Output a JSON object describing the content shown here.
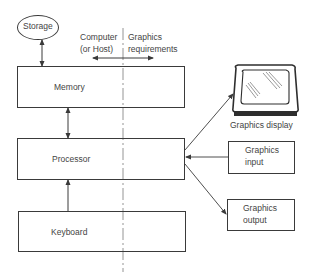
{
  "diagram": {
    "nodes": {
      "storage": {
        "label": "Storage",
        "shape": "ellipse"
      },
      "memory": {
        "label": "Memory",
        "shape": "rectangle"
      },
      "processor": {
        "label": "Processor",
        "shape": "rectangle"
      },
      "keyboard": {
        "label": "Keyboard",
        "shape": "rectangle"
      },
      "graphics_display": {
        "label": "Graphics display",
        "shape": "monitor-icon"
      },
      "graphics_input": {
        "label_line1": "Graphics",
        "label_line2": "input",
        "shape": "rectangle"
      },
      "graphics_output": {
        "label_line1": "Graphics",
        "label_line2": "output",
        "shape": "rectangle"
      }
    },
    "divider": {
      "left_label_line1": "Computer",
      "left_label_line2": "(or Host)",
      "right_label_line1": "Graphics",
      "right_label_line2": "requirements",
      "style": "dash-dot"
    },
    "edges": [
      {
        "from": "storage",
        "to": "memory",
        "direction": "bidirectional"
      },
      {
        "from": "memory",
        "to": "processor",
        "direction": "bidirectional"
      },
      {
        "from": "keyboard",
        "to": "processor",
        "direction": "forward"
      },
      {
        "from": "processor",
        "to": "graphics_display",
        "direction": "forward"
      },
      {
        "from": "graphics_input",
        "to": "processor",
        "direction": "forward"
      },
      {
        "from": "processor",
        "to": "graphics_output",
        "direction": "forward"
      }
    ],
    "colors": {
      "stroke": "#3a3a3a",
      "text": "#444444",
      "background": "#ffffff"
    }
  }
}
